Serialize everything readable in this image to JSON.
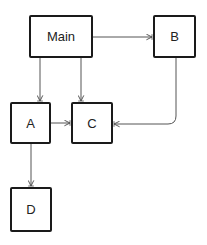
{
  "diagram": {
    "type": "flowchart",
    "nodes": [
      {
        "id": "main",
        "label": "Main",
        "x": 29,
        "y": 15,
        "w": 64,
        "h": 43
      },
      {
        "id": "b",
        "label": "B",
        "x": 153,
        "y": 15,
        "w": 43,
        "h": 43
      },
      {
        "id": "a",
        "label": "A",
        "x": 10,
        "y": 102,
        "w": 41,
        "h": 42
      },
      {
        "id": "c",
        "label": "C",
        "x": 71,
        "y": 102,
        "w": 42,
        "h": 42
      },
      {
        "id": "d",
        "label": "D",
        "x": 10,
        "y": 187,
        "w": 42,
        "h": 45
      }
    ],
    "edges": [
      {
        "from": "main",
        "to": "b"
      },
      {
        "from": "main",
        "to": "a"
      },
      {
        "from": "main",
        "to": "c"
      },
      {
        "from": "a",
        "to": "c"
      },
      {
        "from": "b",
        "to": "c"
      },
      {
        "from": "a",
        "to": "d"
      }
    ],
    "colors": {
      "stroke": "#1a1a1a",
      "edge": "#555555",
      "background": "#ffffff"
    }
  }
}
